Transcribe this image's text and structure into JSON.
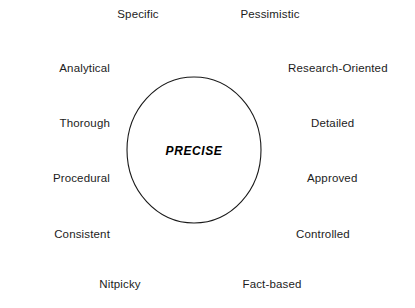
{
  "diagram": {
    "type": "radial-attribute-cluster",
    "background_color": "#ffffff",
    "text_color": "#1c1c1c",
    "stroke_color": "#1a1a1a",
    "core": {
      "label": "PRECISE",
      "shape": "ellipse"
    },
    "traits": {
      "top": [
        {
          "label": "Specific"
        },
        {
          "label": "Pessimistic"
        }
      ],
      "left": [
        {
          "label": "Analytical"
        },
        {
          "label": "Thorough"
        },
        {
          "label": "Procedural"
        },
        {
          "label": "Consistent"
        }
      ],
      "right": [
        {
          "label": "Research-Oriented"
        },
        {
          "label": "Detailed"
        },
        {
          "label": "Approved"
        },
        {
          "label": "Controlled"
        }
      ],
      "bottom": [
        {
          "label": "Nitpicky"
        },
        {
          "label": "Fact-based"
        }
      ]
    }
  }
}
